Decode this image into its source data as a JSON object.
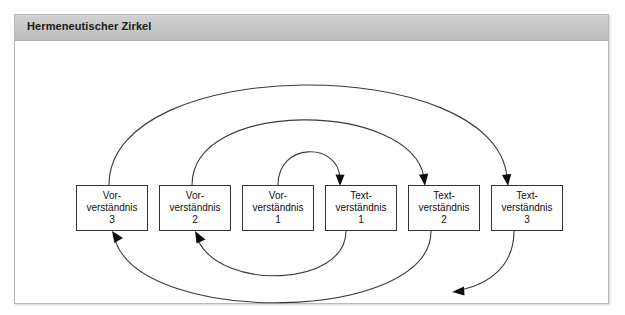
{
  "figure": {
    "title": "Hermeneutischer Zirkel",
    "border_color": "#b9b9b9",
    "header_color": "#c6c6c6",
    "background_color": "#ffffff",
    "line_color": "#3a3a3a"
  },
  "nodes": [
    {
      "id": "vor3",
      "line1": "Vor-",
      "line2": "verständnis",
      "line3": "3",
      "x": 61,
      "y": 144
    },
    {
      "id": "vor2",
      "line1": "Vor-",
      "line2": "verständnis",
      "line3": "2",
      "x": 144,
      "y": 144
    },
    {
      "id": "vor1",
      "line1": "Vor-",
      "line2": "verständnis",
      "line3": "1",
      "x": 227,
      "y": 144
    },
    {
      "id": "text1",
      "line1": "Text-",
      "line2": "verständnis",
      "line3": "1",
      "x": 310,
      "y": 144
    },
    {
      "id": "text2",
      "line1": "Text-",
      "line2": "verständnis",
      "line3": "2",
      "x": 393,
      "y": 144
    },
    {
      "id": "text3",
      "line1": "Text-",
      "line2": "verständnis",
      "line3": "3",
      "x": 476,
      "y": 144
    }
  ],
  "arcs": [
    {
      "id": "arc-vor1-to-text1",
      "from": "vor1",
      "to": "text1",
      "direction": "over-right"
    },
    {
      "id": "arc-text1-to-vor2",
      "from": "text1",
      "to": "vor2",
      "direction": "under-left"
    },
    {
      "id": "arc-vor2-to-text2",
      "from": "vor2",
      "to": "text2",
      "direction": "over-right"
    },
    {
      "id": "arc-text2-to-vor3",
      "from": "text2",
      "to": "vor3",
      "direction": "under-left"
    },
    {
      "id": "arc-vor3-to-text3",
      "from": "vor3",
      "to": "text3",
      "direction": "over-right"
    },
    {
      "id": "arc-text3-outward",
      "from": "text3",
      "to": "open-end",
      "direction": "under-left"
    }
  ]
}
